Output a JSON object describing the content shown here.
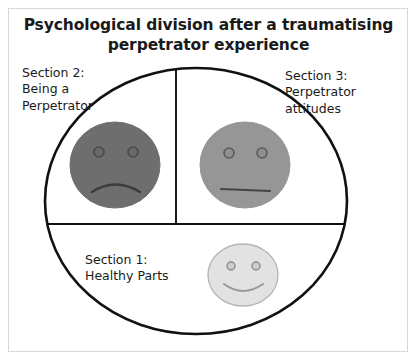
{
  "figure": {
    "title": "Psychological division after a traumatising perpetrator experience",
    "title_line1": "Psychological division after a traumatising",
    "title_line2": "perpetrator experience",
    "background_color": "#ffffff",
    "frame_color": "#d8d8d8",
    "line_color": "#111111"
  },
  "sections": {
    "section1": {
      "label": "Section 1:\nHealthy Parts",
      "title": "Section 1:",
      "subtitle": "Healthy Parts",
      "face": {
        "expression": "smiling",
        "fill_color": "#e2e2e2",
        "stroke_color": "#b5b5b5",
        "eye_color": "#cccccc",
        "eye_stroke": "#8c8c8c",
        "mouth_color": "#9a9a9a"
      }
    },
    "section2": {
      "label": "Section 2:\nBeing a\nPerpetrator",
      "title": "Section 2:",
      "subtitle": "Being a Perpetrator",
      "face": {
        "expression": "frowning",
        "fill_color": "#6e6e6e",
        "stroke_color": "#6e6e6e",
        "eye_color": "#6a6a6a",
        "eye_stroke": "#4a4a4a",
        "mouth_color": "#3c3c3c"
      }
    },
    "section3": {
      "label": "Section 3:\nPerpetrator\nattitudes",
      "title": "Section 3:",
      "subtitle": "Perpetrator attitudes",
      "face": {
        "expression": "neutral",
        "fill_color": "#969696",
        "stroke_color": "#969696",
        "eye_color": "#8f8f8f",
        "eye_stroke": "#5a5a5a",
        "mouth_color": "#444444"
      }
    }
  },
  "icons": {
    "big-circle": "psyche-boundary-circle",
    "vertical-divider": "divider-vertical",
    "horizontal-divider": "divider-horizontal"
  }
}
